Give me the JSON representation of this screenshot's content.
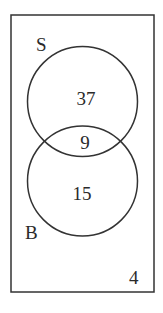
{
  "diagram": {
    "type": "venn",
    "universe": {
      "label": "",
      "outside_value": "4"
    },
    "sets": [
      {
        "name": "S",
        "label": "S",
        "only_value": "37"
      },
      {
        "name": "B",
        "label": "B",
        "only_value": "15"
      }
    ],
    "intersection": {
      "sets": [
        "S",
        "B"
      ],
      "value": "9"
    },
    "colors": {
      "stroke": "#333333",
      "text": "#2a2a2a",
      "background": "#ffffff"
    }
  }
}
